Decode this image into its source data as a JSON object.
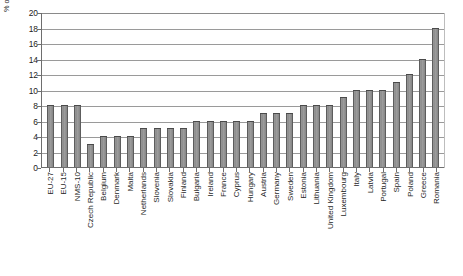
{
  "chart_data": {
    "type": "bar",
    "title": "",
    "xlabel": "",
    "ylabel": "% of people employed aged 18 or more",
    "ylim": [
      0,
      20
    ],
    "ytick_step": 2,
    "ytick_labels": [
      "20",
      "18",
      "16",
      "14",
      "12",
      "10",
      "8",
      "6",
      "4",
      "2",
      "0"
    ],
    "grid": true,
    "legend": "none",
    "bar_color": "#8c8c8c",
    "bar_edge_color": "#4a4a4a",
    "axis_color": "#6e6e6e",
    "gridline_color": "#9a9a9a",
    "categories": [
      "EU-27",
      "EU-15",
      "NMS-10",
      "Czech Republic",
      "Belgium",
      "Denmark",
      "Malta",
      "Netherlands",
      "Slovenia",
      "Slovakia",
      "Finland",
      "Bulgaria",
      "Ireland",
      "France",
      "Cyprus",
      "Hungary",
      "Austria",
      "Germany",
      "Sweden",
      "Estonia",
      "Lithuania",
      "United Kingdom",
      "Luxembourg",
      "Italy",
      "Latvia",
      "Portugal",
      "Spain",
      "Poland",
      "Greece",
      "Romania"
    ],
    "values": [
      8,
      8,
      8,
      3,
      4,
      4,
      4,
      5,
      5,
      5,
      5,
      6,
      6,
      6,
      6,
      6,
      7,
      7,
      7,
      8,
      8,
      8,
      9,
      10,
      10,
      10,
      11,
      12,
      14,
      18
    ]
  }
}
